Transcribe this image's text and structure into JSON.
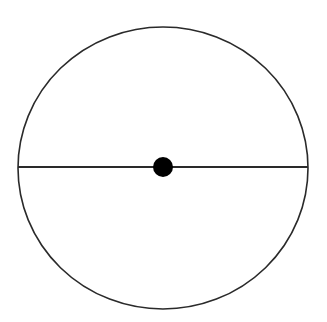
{
  "diagram": {
    "background": "#ffffff",
    "stroke_color": "#2a2a2a",
    "circle": {
      "cx": 163,
      "cy": 168,
      "rx": 145,
      "ry": 141
    },
    "diameter": {
      "x1": 18,
      "y1": 167,
      "x2": 308,
      "y2": 167
    },
    "center_point": {
      "cx": 163,
      "cy": 167,
      "r": 10,
      "fill": "#000000"
    }
  }
}
